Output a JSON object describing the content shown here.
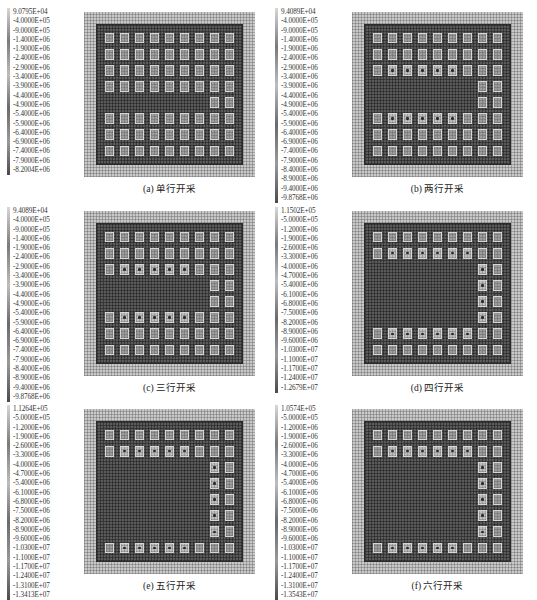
{
  "chart_data": [
    {
      "type": "heatmap",
      "title": "(a) 单行开采",
      "label": "(a)",
      "caption": "单行开采",
      "grid": {
        "columns": 9,
        "rows": 8
      },
      "mined_rows": [
        4
      ],
      "legend_ticks": [
        "9.0795E+04",
        "-4.0000E+05",
        "-9.0000E+05",
        "-1.4000E+06",
        "-1.9000E+06",
        "-2.4000E+06",
        "-2.9000E+06",
        "-3.4000E+06",
        "-3.9000E+06",
        "-4.4000E+06",
        "-4.9000E+06",
        "-5.4000E+06",
        "-5.9000E+06",
        "-6.4000E+06",
        "-6.9000E+06",
        "-7.4000E+06",
        "-7.9000E+06",
        "-8.2004E+06"
      ],
      "range": [
        -8200400.0,
        90795.0
      ]
    },
    {
      "type": "heatmap",
      "title": "(b) 两行开采",
      "label": "(b)",
      "caption": "两行开采",
      "grid": {
        "columns": 9,
        "rows": 8
      },
      "mined_rows": [
        3,
        4
      ],
      "legend_ticks": [
        "9.4089E+04",
        "-4.0000E+05",
        "-9.0000E+05",
        "-1.4000E+06",
        "-1.9000E+06",
        "-2.4000E+06",
        "-2.9000E+06",
        "-3.4000E+06",
        "-3.9000E+06",
        "-4.4000E+06",
        "-4.9000E+06",
        "-5.4000E+06",
        "-5.9000E+06",
        "-6.4000E+06",
        "-6.9000E+06",
        "-7.4000E+06",
        "-7.9000E+06",
        "-8.4000E+06",
        "-8.9000E+06",
        "-9.4000E+06",
        "-9.8768E+06"
      ],
      "range": [
        -9876800.0,
        94089.0
      ]
    },
    {
      "type": "heatmap",
      "title": "(c) 三行开采",
      "label": "(c)",
      "caption": "三行开采",
      "grid": {
        "columns": 9,
        "rows": 8
      },
      "mined_rows": [
        3,
        4
      ],
      "legend_ticks": [
        "9.4089E+04",
        "-4.0000E+05",
        "-9.0000E+05",
        "-1.4000E+06",
        "-1.9000E+06",
        "-2.4000E+06",
        "-2.9000E+06",
        "-3.4000E+06",
        "-3.9000E+06",
        "-4.4000E+06",
        "-4.9000E+06",
        "-5.4000E+06",
        "-5.9000E+06",
        "-6.4000E+06",
        "-6.9000E+06",
        "-7.4000E+06",
        "-7.9000E+06",
        "-8.4000E+06",
        "-8.9000E+06",
        "-9.4000E+06",
        "-9.8768E+06"
      ],
      "range": [
        -9876800.0,
        94089.0
      ]
    },
    {
      "type": "heatmap",
      "title": "(d) 四行开采",
      "label": "(d)",
      "caption": "四行开采",
      "grid": {
        "columns": 9,
        "rows": 8
      },
      "mined_rows": [
        2,
        3,
        4,
        5
      ],
      "legend_ticks": [
        "1.1502E+05",
        "-5.0000E+05",
        "-1.2000E+06",
        "-1.9000E+06",
        "-2.6000E+06",
        "-3.3000E+06",
        "-4.0000E+06",
        "-4.7000E+06",
        "-5.4000E+06",
        "-6.1000E+06",
        "-6.8000E+06",
        "-7.5000E+06",
        "-8.2000E+06",
        "-8.9000E+06",
        "-9.6000E+06",
        "-1.0300E+07",
        "-1.1000E+07",
        "-1.1700E+07",
        "-1.2400E+07",
        "-1.2679E+07"
      ],
      "range": [
        -12679000.0,
        115020.0
      ]
    },
    {
      "type": "heatmap",
      "title": "(e) 五行开采",
      "label": "(e)",
      "caption": "五行开采",
      "grid": {
        "columns": 9,
        "rows": 8
      },
      "mined_rows": [
        2,
        3,
        4,
        5,
        6
      ],
      "legend_ticks": [
        "1.1264E+05",
        "-5.0000E+05",
        "-1.2000E+06",
        "-1.9000E+06",
        "-2.6000E+06",
        "-3.3000E+06",
        "-4.0000E+06",
        "-4.7000E+06",
        "-5.4000E+06",
        "-6.1000E+06",
        "-6.8000E+06",
        "-7.5000E+06",
        "-8.2000E+06",
        "-8.9000E+06",
        "-9.6000E+06",
        "-1.0300E+07",
        "-1.1000E+07",
        "-1.1700E+07",
        "-1.2400E+07",
        "-1.3100E+07",
        "-1.3413E+07"
      ],
      "range": [
        -13413000.0,
        112640.0
      ]
    },
    {
      "type": "heatmap",
      "title": "(f) 六行开采",
      "label": "(f)",
      "caption": "六行开采",
      "grid": {
        "columns": 9,
        "rows": 8
      },
      "mined_rows": [
        2,
        3,
        4,
        5,
        6
      ],
      "legend_ticks": [
        "1.0574E+05",
        "-5.0000E+05",
        "-1.2000E+06",
        "-1.9000E+06",
        "-2.6000E+06",
        "-3.3000E+06",
        "-4.0000E+06",
        "-4.7000E+06",
        "-5.4000E+06",
        "-6.1000E+06",
        "-6.8000E+06",
        "-7.5000E+06",
        "-8.2000E+06",
        "-8.9000E+06",
        "-9.6000E+06",
        "-1.0300E+07",
        "-1.1000E+07",
        "-1.1700E+07",
        "-1.2400E+07",
        "-1.3100E+07",
        "-1.3543E+07"
      ],
      "range": [
        -13543000.0,
        105740.0
      ]
    }
  ],
  "panels": [
    {
      "label": "(a)",
      "caption": "(a)  单行开采"
    },
    {
      "label": "(b)",
      "caption": "(b)  两行开采"
    },
    {
      "label": "(c)",
      "caption": "(c)  三行开采"
    },
    {
      "label": "(d)",
      "caption": "(d)  四行开采"
    },
    {
      "label": "(e)",
      "caption": "(e)  五行开采"
    },
    {
      "label": "(f)",
      "caption": "(f)  六行开采"
    }
  ],
  "colors": {
    "background": "#ffffff",
    "outer_field": "#c9c9c9",
    "mined_zone": "#5a5a5a",
    "pillar": "#9d9d9d",
    "stress_peak": "#2a2a2a"
  }
}
